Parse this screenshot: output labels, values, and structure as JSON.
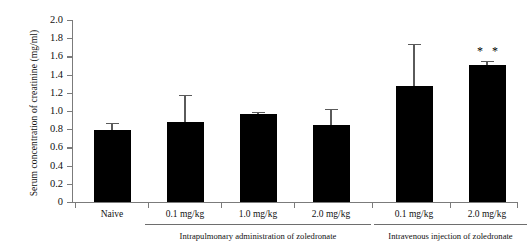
{
  "chart_data": {
    "type": "bar",
    "title": "",
    "xlabel": "",
    "ylabel": "Serum concentration of creatinine (mg/ml)",
    "ylim": [
      0,
      2.0
    ],
    "ytick_labels": [
      "2.0",
      "1.8",
      "1.6",
      "1.4",
      "1.2",
      "1.0",
      "0.8",
      "0.6",
      "0.4",
      "0.2",
      "0"
    ],
    "ytick_values": [
      2.0,
      1.8,
      1.6,
      1.4,
      1.2,
      1.0,
      0.8,
      0.6,
      0.4,
      0.2,
      0
    ],
    "grid": false,
    "legend": "none",
    "categories": [
      "Naive",
      "0.1 mg/kg",
      "1.0 mg/kg",
      "2.0 mg/kg",
      "0.1 mg/kg",
      "2.0 mg/kg"
    ],
    "values": [
      0.79,
      0.88,
      0.97,
      0.85,
      1.27,
      1.51
    ],
    "errors_upper": [
      0.87,
      1.18,
      0.99,
      1.02,
      1.74,
      1.55
    ],
    "annotations": [
      {
        "category": "2.0 mg/kg",
        "group": "Intravenous injection of zoledronate",
        "text": "* *",
        "bar_index": 5
      }
    ],
    "groups": [
      {
        "label": "Intrapulmonary administration of zoledronate",
        "bar_indices": [
          1,
          2,
          3
        ]
      },
      {
        "label": "Intravenous injection of zoledronate",
        "bar_indices": [
          4,
          5
        ]
      }
    ],
    "bar_color": "#000000",
    "axis_color": "#7b7b7b"
  }
}
